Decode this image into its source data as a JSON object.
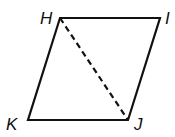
{
  "figure": {
    "type": "parallelogram",
    "vertices": [
      {
        "label": "H",
        "x": 60,
        "y": 18,
        "lx": 40,
        "ly": 24
      },
      {
        "label": "I",
        "x": 160,
        "y": 18,
        "lx": 165,
        "ly": 24
      },
      {
        "label": "J",
        "x": 128,
        "y": 120,
        "lx": 134,
        "ly": 130
      },
      {
        "label": "K",
        "x": 28,
        "y": 120,
        "lx": 6,
        "ly": 130
      }
    ],
    "sides": [
      "HI",
      "IJ",
      "JK",
      "KH"
    ],
    "diagonal": {
      "from": "H",
      "to": "J",
      "style": "dashed"
    },
    "stroke_color": "#111111"
  }
}
